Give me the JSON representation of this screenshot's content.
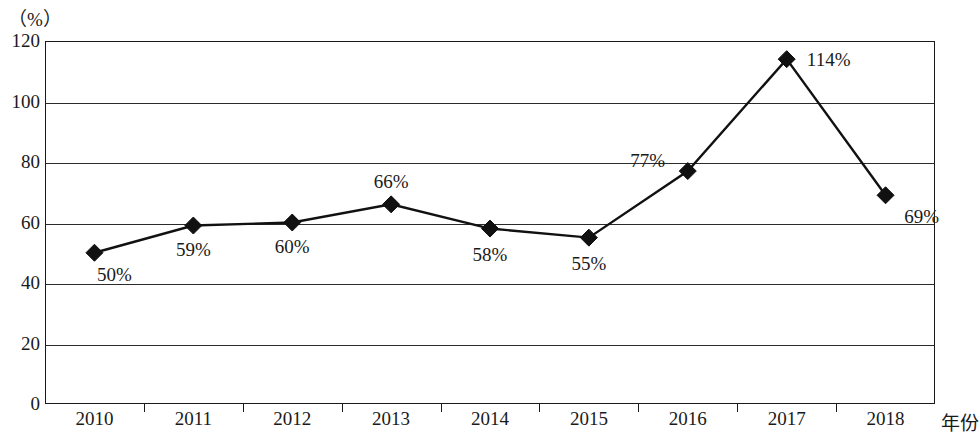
{
  "chart_data": {
    "type": "line",
    "title": "",
    "subtitle": "",
    "xlabel": "年份",
    "ylabel": "（%）",
    "categories": [
      "2010",
      "2011",
      "2012",
      "2013",
      "2014",
      "2015",
      "2016",
      "2017",
      "2018"
    ],
    "values": [
      50,
      59,
      60,
      66,
      58,
      55,
      77,
      114,
      69
    ],
    "point_labels": [
      "50%",
      "59%",
      "60%",
      "66%",
      "58%",
      "55%",
      "77%",
      "114%",
      "69%"
    ],
    "ylim": [
      0,
      120
    ],
    "yticks": [
      "0",
      "20",
      "40",
      "60",
      "80",
      "100",
      "120"
    ],
    "ytick_values": [
      0,
      20,
      40,
      60,
      80,
      100,
      120
    ],
    "grid": "horizontal",
    "legend": "none",
    "marker": "diamond",
    "series": [
      {
        "name": "",
        "values": [
          50,
          59,
          60,
          66,
          58,
          55,
          77,
          114,
          69
        ]
      }
    ],
    "colors": {
      "line": "#111111",
      "marker": "#111111",
      "grid": "#2b2b2b",
      "frame": "#1a1a1a",
      "background": "#ffffff",
      "text": "#1a1a1a"
    },
    "label_offsets": [
      {
        "dx": 20,
        "dy": 22
      },
      {
        "dx": 0,
        "dy": 24
      },
      {
        "dx": 0,
        "dy": 24
      },
      {
        "dx": 0,
        "dy": -22
      },
      {
        "dx": 0,
        "dy": 26
      },
      {
        "dx": 0,
        "dy": 26
      },
      {
        "dx": -40,
        "dy": -10
      },
      {
        "dx": 42,
        "dy": 1
      },
      {
        "dx": 36,
        "dy": 22
      }
    ]
  }
}
